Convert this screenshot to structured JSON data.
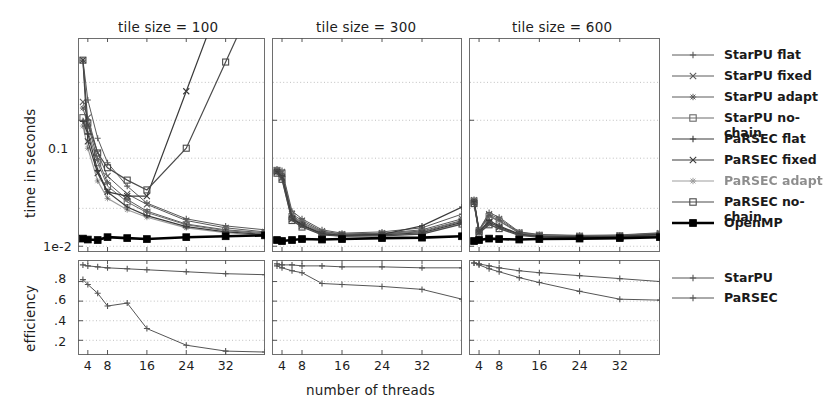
{
  "figure": {
    "xlabel": "number of threads",
    "top_ylabel": "time in seconds",
    "bottom_ylabel": "efficiency"
  },
  "panels": [
    {
      "title": "tile size = 100"
    },
    {
      "title": "tile size = 300"
    },
    {
      "title": "tile size = 600"
    }
  ],
  "axes": {
    "x_ticks": [
      "4",
      "8",
      "16",
      "24",
      "32"
    ],
    "x_tick_values": [
      4,
      8,
      16,
      24,
      32
    ],
    "top_y_ticks": [
      "0.1",
      "1e-2"
    ],
    "top_y_tick_values": [
      0.1,
      0.01
    ],
    "bottom_y_ticks": [
      ".8",
      ".6",
      ".4",
      ".2"
    ],
    "bottom_y_tick_values": [
      0.8,
      0.6,
      0.4,
      0.2
    ]
  },
  "legend_top": {
    "items": [
      {
        "label": "StarPU flat",
        "marker": "plus",
        "color": "#5a5a5a",
        "width": 1.0,
        "blurred": false
      },
      {
        "label": "StarPU fixed",
        "marker": "cross",
        "color": "#5a5a5a",
        "width": 1.0,
        "blurred": false
      },
      {
        "label": "StarPU adapt",
        "marker": "star",
        "color": "#5a5a5a",
        "width": 1.0,
        "blurred": false
      },
      {
        "label": "StarPU no-chain",
        "marker": "square-open",
        "color": "#6a6a6a",
        "width": 1.0,
        "blurred": false
      },
      {
        "label": "PaRSEC flat",
        "marker": "plus",
        "color": "#3a3a3a",
        "width": 1.2,
        "blurred": false
      },
      {
        "label": "PaRSEC fixed",
        "marker": "cross",
        "color": "#3a3a3a",
        "width": 1.2,
        "blurred": false
      },
      {
        "label": "PaRSEC adapt",
        "marker": "star",
        "color": "#4a4a4a",
        "width": 1.2,
        "blurred": true
      },
      {
        "label": "PaRSEC no-chain",
        "marker": "square-open",
        "color": "#4a4a4a",
        "width": 1.2,
        "blurred": false
      },
      {
        "label": "OpenMP",
        "marker": "square-filled",
        "color": "#000000",
        "width": 2.6,
        "blurred": false
      }
    ]
  },
  "legend_bottom": {
    "items": [
      {
        "label": "StarPU",
        "marker": "plus",
        "color": "#555555",
        "width": 1.0
      },
      {
        "label": "PaRSEC",
        "marker": "plus",
        "color": "#555555",
        "width": 1.0
      }
    ]
  },
  "chart_data": {
    "type": "line",
    "title": "",
    "xlabel": "number of threads",
    "grid": true,
    "legend_position": "right",
    "subplots": [
      {
        "row": "time",
        "panel": "tile size = 100",
        "ylabel": "time in seconds",
        "yscale": "log",
        "ylim": [
          0.009,
          0.45
        ],
        "xlim": [
          2,
          40
        ],
        "x": [
          3,
          4,
          6,
          8,
          12,
          16,
          24,
          32,
          40
        ],
        "series": [
          {
            "name": "StarPU flat",
            "values": [
              0.3,
              0.145,
              0.072,
              0.046,
              0.03,
              0.022,
              0.0165,
              0.0145,
              0.0135
            ]
          },
          {
            "name": "StarPU fixed",
            "values": [
              0.14,
              0.105,
              0.055,
              0.036,
              0.026,
              0.0215,
              0.016,
              0.014,
              0.013
            ]
          },
          {
            "name": "StarPU adapt",
            "values": [
              0.125,
              0.092,
              0.049,
              0.032,
              0.0235,
              0.019,
              0.015,
              0.0135,
              0.0128
            ]
          },
          {
            "name": "StarPU no-chain",
            "values": [
              0.105,
              0.082,
              0.046,
              0.03,
              0.0225,
              0.0185,
              0.0148,
              0.0133,
              0.0126
            ]
          },
          {
            "name": "PaRSEC flat",
            "values": [
              0.098,
              0.078,
              0.04,
              0.027,
              0.0205,
              0.0175,
              0.0143,
              0.013,
              0.0124
            ]
          },
          {
            "name": "PaRSEC fixed",
            "values": [
              0.3,
              0.068,
              0.038,
              0.027,
              0.025,
              0.025,
              0.17,
              null,
              null
            ]
          },
          {
            "name": "PaRSEC adapt",
            "values": [
              0.09,
              0.06,
              0.033,
              0.024,
              0.0195,
              0.017,
              0.014,
              0.0128,
              0.0122
            ]
          },
          {
            "name": "PaRSEC no-chain",
            "values": [
              0.3,
              0.095,
              0.055,
              0.042,
              0.0335,
              0.028,
              0.06,
              0.29,
              null
            ]
          },
          {
            "name": "OpenMP",
            "values": [
              0.0115,
              0.0113,
              0.0112,
              0.0118,
              0.0116,
              0.0114,
              0.0118,
              0.012,
              0.0122
            ]
          }
        ]
      },
      {
        "row": "time",
        "panel": "tile size = 300",
        "yscale": "log",
        "ylim": [
          0.009,
          0.45
        ],
        "xlim": [
          2,
          40
        ],
        "x": [
          3,
          4,
          6,
          8,
          12,
          16,
          24,
          32,
          40
        ],
        "series": [
          {
            "name": "StarPU flat",
            "values": [
              0.041,
              0.04,
              0.019,
              0.0165,
              0.0135,
              0.0127,
              0.013,
              0.014,
              0.018
            ]
          },
          {
            "name": "StarPU fixed",
            "values": [
              0.04,
              0.039,
              0.018,
              0.016,
              0.0132,
              0.0125,
              0.0127,
              0.0135,
              0.0165
            ]
          },
          {
            "name": "StarPU adapt",
            "values": [
              0.04,
              0.038,
              0.0175,
              0.0155,
              0.013,
              0.0124,
              0.0126,
              0.0132,
              0.016
            ]
          },
          {
            "name": "StarPU no-chain",
            "values": [
              0.04,
              0.038,
              0.0172,
              0.0152,
              0.0128,
              0.0123,
              0.0125,
              0.013,
              0.0158
            ]
          },
          {
            "name": "PaRSEC flat",
            "values": [
              0.039,
              0.036,
              0.0168,
              0.0148,
              0.0126,
              0.0122,
              0.0124,
              0.0145,
              0.0205
            ]
          },
          {
            "name": "PaRSEC fixed",
            "values": [
              0.039,
              0.035,
              0.0165,
              0.0146,
              0.0125,
              0.0121,
              0.0123,
              0.0128,
              0.0155
            ]
          },
          {
            "name": "PaRSEC adapt",
            "values": [
              0.038,
              0.034,
              0.0162,
              0.0144,
              0.0124,
              0.012,
              0.0122,
              0.0126,
              0.0152
            ]
          },
          {
            "name": "PaRSEC no-chain",
            "values": [
              0.038,
              0.034,
              0.016,
              0.0142,
              0.0123,
              0.012,
              0.0121,
              0.0125,
              0.015
            ]
          },
          {
            "name": "OpenMP",
            "values": [
              0.0112,
              0.011,
              0.0112,
              0.0114,
              0.0113,
              0.0114,
              0.0116,
              0.0117,
              0.012
            ]
          }
        ]
      },
      {
        "row": "time",
        "panel": "tile size = 600",
        "yscale": "log",
        "ylim": [
          0.009,
          0.45
        ],
        "xlim": [
          2,
          40
        ],
        "x": [
          3,
          4,
          6,
          8,
          12,
          16,
          24,
          32,
          40
        ],
        "series": [
          {
            "name": "StarPU flat",
            "values": [
              0.0235,
              0.0135,
              0.0185,
              0.017,
              0.013,
              0.0124,
              0.0122,
              0.0123,
              0.0128
            ]
          },
          {
            "name": "StarPU fixed",
            "values": [
              0.0232,
              0.0134,
              0.018,
              0.0165,
              0.0129,
              0.0123,
              0.0121,
              0.0122,
              0.0127
            ]
          },
          {
            "name": "StarPU adapt",
            "values": [
              0.023,
              0.0133,
              0.0175,
              0.016,
              0.0128,
              0.0122,
              0.012,
              0.0121,
              0.0126
            ]
          },
          {
            "name": "StarPU no-chain",
            "values": [
              0.0228,
              0.0132,
              0.0172,
              0.0158,
              0.0127,
              0.0122,
              0.012,
              0.0121,
              0.0125
            ]
          },
          {
            "name": "PaRSEC flat",
            "values": [
              0.0225,
              0.013,
              0.016,
              0.0145,
              0.0125,
              0.012,
              0.0119,
              0.012,
              0.0124
            ]
          },
          {
            "name": "PaRSEC fixed",
            "values": [
              0.0222,
              0.0129,
              0.0155,
              0.0142,
              0.0124,
              0.0119,
              0.0118,
              0.0119,
              0.0123
            ]
          },
          {
            "name": "PaRSEC adapt",
            "values": [
              0.022,
              0.0128,
              0.015,
              0.014,
              0.0123,
              0.0119,
              0.0118,
              0.0119,
              0.0122
            ]
          },
          {
            "name": "PaRSEC no-chain",
            "values": [
              0.0218,
              0.0127,
              0.0148,
              0.0138,
              0.0122,
              0.0118,
              0.0117,
              0.0118,
              0.0121
            ]
          },
          {
            "name": "OpenMP",
            "values": [
              0.011,
              0.0112,
              0.0115,
              0.0114,
              0.0113,
              0.0114,
              0.0115,
              0.0116,
              0.0118
            ]
          }
        ]
      },
      {
        "row": "efficiency",
        "panel": "tile size = 100",
        "ylabel": "efficiency",
        "yscale": "linear",
        "ylim": [
          0.05,
          1.02
        ],
        "xlim": [
          2,
          40
        ],
        "x": [
          3,
          4,
          6,
          8,
          12,
          16,
          24,
          32,
          40
        ],
        "series": [
          {
            "name": "StarPU",
            "values": [
              0.97,
              0.96,
              0.95,
              0.94,
              0.93,
              0.92,
              0.9,
              0.88,
              0.87
            ]
          },
          {
            "name": "PaRSEC",
            "values": [
              0.82,
              0.77,
              0.68,
              0.55,
              0.58,
              0.32,
              0.15,
              0.09,
              0.08
            ]
          }
        ]
      },
      {
        "row": "efficiency",
        "panel": "tile size = 300",
        "yscale": "linear",
        "ylim": [
          0.05,
          1.02
        ],
        "xlim": [
          2,
          40
        ],
        "x": [
          3,
          4,
          6,
          8,
          12,
          16,
          24,
          32,
          40
        ],
        "series": [
          {
            "name": "StarPU",
            "values": [
              0.98,
              0.97,
              0.97,
              0.96,
              0.96,
              0.95,
              0.95,
              0.94,
              0.94
            ]
          },
          {
            "name": "PaRSEC",
            "values": [
              0.96,
              0.94,
              0.91,
              0.89,
              0.78,
              0.77,
              0.75,
              0.72,
              0.62
            ]
          }
        ]
      },
      {
        "row": "efficiency",
        "panel": "tile size = 600",
        "yscale": "linear",
        "ylim": [
          0.05,
          1.02
        ],
        "xlim": [
          2,
          40
        ],
        "x": [
          3,
          4,
          6,
          8,
          12,
          16,
          24,
          32,
          40
        ],
        "series": [
          {
            "name": "StarPU",
            "values": [
              0.99,
              0.98,
              0.96,
              0.94,
              0.91,
              0.89,
              0.86,
              0.83,
              0.8
            ]
          },
          {
            "name": "PaRSEC",
            "values": [
              0.99,
              0.97,
              0.93,
              0.9,
              0.84,
              0.79,
              0.7,
              0.62,
              0.61
            ]
          }
        ]
      }
    ]
  }
}
